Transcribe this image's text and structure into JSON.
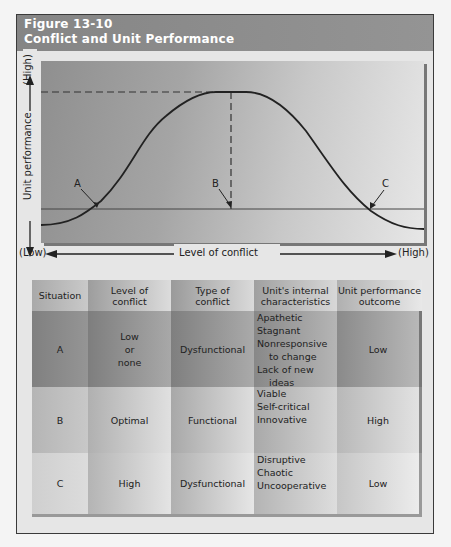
{
  "figure": {
    "number": "Figure 13-10",
    "title": "Conflict and Unit Performance"
  },
  "diagram": {
    "y_axis_label": "Unit performance",
    "y_axis_high": "(High)",
    "x_axis_label": "Level of conflict",
    "x_axis_low": "(Low)",
    "x_axis_high": "(High)",
    "points": [
      {
        "label": "A",
        "meaning": "Low conflict, low performance"
      },
      {
        "label": "B",
        "meaning": "Optimal conflict, peak performance"
      },
      {
        "label": "C",
        "meaning": "High conflict, low performance"
      }
    ],
    "curve": "inverted-U (bell shaped)"
  },
  "table": {
    "headers": [
      "Situation",
      "Level of conflict",
      "Type of conflict",
      "Unit's internal characteristics",
      "Unit performance outcome"
    ],
    "header_lines": [
      [
        "Situation"
      ],
      [
        "Level of",
        "conflict"
      ],
      [
        "Type of",
        "conflict"
      ],
      [
        "Unit's internal",
        "characteristics"
      ],
      [
        "Unit performance",
        "outcome"
      ]
    ],
    "rows": [
      {
        "situation": "A",
        "level_lines": [
          "Low",
          "or",
          "none"
        ],
        "type": "Dysfunctional",
        "characteristics": [
          "Apathetic",
          "Stagnant",
          "Nonresponsive",
          "to change",
          "Lack of new",
          "ideas"
        ],
        "outcome": "Low"
      },
      {
        "situation": "B",
        "level_lines": [
          "Optimal"
        ],
        "type": "Functional",
        "characteristics": [
          "Viable",
          "Self-critical",
          "Innovative"
        ],
        "outcome": "High"
      },
      {
        "situation": "C",
        "level_lines": [
          "High"
        ],
        "type": "Dysfunctional",
        "characteristics": [
          "Disruptive",
          "Chaotic",
          "Uncooperative"
        ],
        "outcome": "Low"
      }
    ]
  },
  "colors": {
    "title_bar": "#8a8a8a",
    "frame_bg": "#e6e6e6",
    "curve": "#222222"
  }
}
